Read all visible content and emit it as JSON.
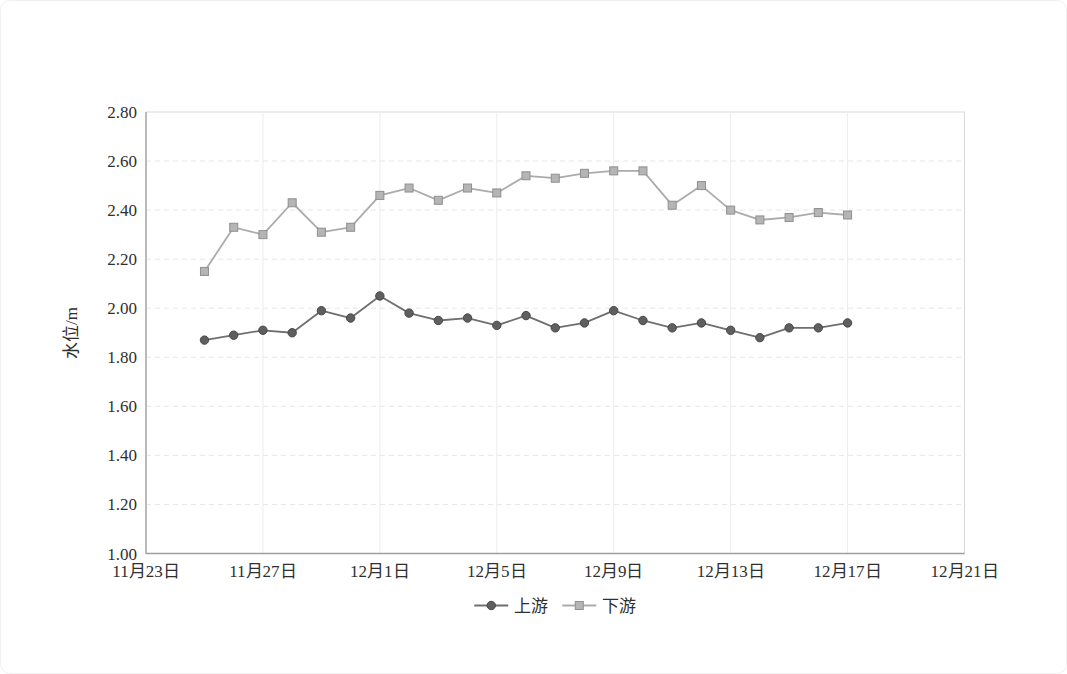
{
  "chart_data": {
    "type": "line",
    "title": "",
    "xlabel": "",
    "ylabel": "水位/m",
    "ylim": [
      1.0,
      2.8
    ],
    "y_tick_step": 0.2,
    "y_tick_labels": [
      "1.00",
      "1.20",
      "1.40",
      "1.60",
      "1.80",
      "2.00",
      "2.20",
      "2.40",
      "2.60",
      "2.80"
    ],
    "x_tick_labels": [
      "11月23日",
      "11月27日",
      "12月1日",
      "12月5日",
      "12月9日",
      "12月13日",
      "12月17日",
      "12月21日"
    ],
    "x_tick_day_offsets": [
      0,
      4,
      8,
      12,
      16,
      20,
      24,
      28
    ],
    "x_axis_days_span": 28,
    "series_start_day_offset": 2,
    "grid": true,
    "legend_position": "bottom-center",
    "dates": [
      "11月25日",
      "11月26日",
      "11月27日",
      "11月28日",
      "11月29日",
      "11月30日",
      "12月1日",
      "12月2日",
      "12月3日",
      "12月4日",
      "12月5日",
      "12月6日",
      "12月7日",
      "12月8日",
      "12月9日",
      "12月10日",
      "12月11日",
      "12月12日",
      "12月13日",
      "12月14日",
      "12月15日",
      "12月16日",
      "12月17日"
    ],
    "series": [
      {
        "name": "上游",
        "marker": "circle",
        "line_color": "#6f6f6f",
        "marker_fill": "#5f5f5f",
        "marker_stroke": "#474747",
        "values": [
          1.87,
          1.89,
          1.91,
          1.9,
          1.99,
          1.96,
          2.05,
          1.98,
          1.95,
          1.96,
          1.93,
          1.97,
          1.92,
          1.94,
          1.99,
          1.95,
          1.92,
          1.94,
          1.91,
          1.88,
          1.92,
          1.92,
          1.94
        ]
      },
      {
        "name": "下游",
        "marker": "square",
        "line_color": "#ababab",
        "marker_fill": "#b5b5b5",
        "marker_stroke": "#8f8f8f",
        "values": [
          2.15,
          2.33,
          2.3,
          2.43,
          2.31,
          2.33,
          2.46,
          2.49,
          2.44,
          2.49,
          2.47,
          2.54,
          2.53,
          2.55,
          2.56,
          2.56,
          2.42,
          2.5,
          2.4,
          2.36,
          2.37,
          2.39,
          2.38
        ]
      }
    ],
    "colors": {
      "axis": "#9e9e9e",
      "plot_border": "#d9d9d9",
      "grid_h": "#e6e6e6",
      "grid_v": "#ededed",
      "tick_text": "#2f2f2f"
    }
  }
}
